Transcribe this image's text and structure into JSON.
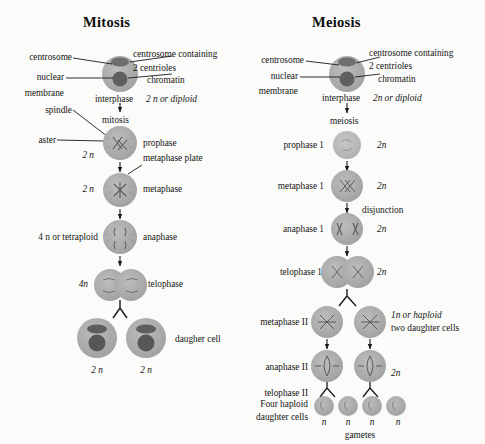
{
  "figure": {
    "background_color": "#fbfbfa",
    "cell_fill": "#a9a9a9",
    "cell_fill_light": "#b4b4b4",
    "nucleus_fill": "#6f6f6f",
    "ink": "#151515"
  },
  "columns": [
    {
      "id": "mitosis",
      "title": "Mitosis",
      "pointer_labels": [
        {
          "name": "centrosome",
          "text": "centrosome"
        },
        {
          "name": "nuclear",
          "text": "nuclear"
        },
        {
          "name": "membrane",
          "text": "membrane"
        },
        {
          "name": "centrosome-containing",
          "text": "centrosome containing"
        },
        {
          "name": "two-centrioles",
          "text": "2 centrioles"
        },
        {
          "name": "chromatin",
          "text": "chromatin"
        },
        {
          "name": "spindle",
          "text": "spindle"
        },
        {
          "name": "aster",
          "text": "aster"
        },
        {
          "name": "metaphase-plate",
          "text": "metaphase plate"
        }
      ],
      "stages": [
        {
          "name": "interphase",
          "stage": "interphase",
          "ploidy": "2 n or diploid",
          "left_ploidy": ""
        },
        {
          "name": "division-label",
          "stage": "mitosis",
          "ploidy": "",
          "left_ploidy": ""
        },
        {
          "name": "prophase",
          "stage": "prophase",
          "ploidy": "",
          "left_ploidy": "2 n"
        },
        {
          "name": "metaphase",
          "stage": "metaphase",
          "ploidy": "",
          "left_ploidy": "2 n"
        },
        {
          "name": "anaphase",
          "stage": "anaphase",
          "ploidy": "",
          "left_ploidy": "4 n or tetraploid"
        },
        {
          "name": "telophase",
          "stage": "telophase",
          "ploidy": "",
          "left_ploidy": "4n"
        },
        {
          "name": "daughter-cell",
          "stage": "daugher cell",
          "ploidy": "",
          "left_ploidy": ""
        }
      ],
      "daughter_ploidy": [
        "2 n",
        "2 n"
      ]
    },
    {
      "id": "meiosis",
      "title": "Meiosis",
      "pointer_labels": [
        {
          "name": "centrosome",
          "text": "centrosome"
        },
        {
          "name": "nuclear",
          "text": "nuclear"
        },
        {
          "name": "membrane",
          "text": "membrane"
        },
        {
          "name": "centrosome-containing",
          "text": "centrosome containing"
        },
        {
          "name": "two-centrioles",
          "text": "2 centrioles"
        },
        {
          "name": "chromatin",
          "text": "chromatin"
        }
      ],
      "stages": [
        {
          "name": "interphase",
          "stage": "interphase",
          "ploidy": "2n or diploid"
        },
        {
          "name": "division-label",
          "stage": "meiosis",
          "ploidy": ""
        },
        {
          "name": "prophase-1",
          "stage": "prophase 1",
          "ploidy": "2n"
        },
        {
          "name": "metaphase-1",
          "stage": "metaphase 1",
          "ploidy": "2n"
        },
        {
          "name": "disjunction",
          "stage": "disjunction",
          "ploidy": ""
        },
        {
          "name": "anaphase-1",
          "stage": "anaphase 1",
          "ploidy": "2n"
        },
        {
          "name": "telophase-1",
          "stage": "telophase 1",
          "ploidy": "2n"
        },
        {
          "name": "metaphase-2",
          "stage": "metaphase II",
          "ploidy": "1n or haploid"
        },
        {
          "name": "metaphase-2-note",
          "stage": "",
          "ploidy": "two daughter cells"
        },
        {
          "name": "anaphase-2",
          "stage": "anaphase II",
          "ploidy": "2n"
        },
        {
          "name": "telophase-2",
          "stage": "telophase II",
          "ploidy": ""
        }
      ],
      "four_haploid_label_line1": "Four haploid",
      "four_haploid_label_line2": "daughter cells",
      "gamete_ploidy": [
        "n",
        "n",
        "n",
        "n"
      ],
      "gametes_label": "gametes"
    }
  ]
}
